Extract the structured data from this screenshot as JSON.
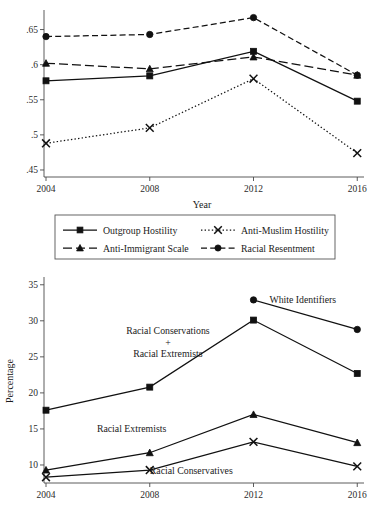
{
  "figure": {
    "title": "",
    "background": "#ffffff",
    "line_color": "#111111",
    "axis_color": "#4a4a4a"
  },
  "legend": {
    "items": [
      {
        "label": "Outgroup Hostility",
        "marker": "square",
        "dash": "solid"
      },
      {
        "label": "Anti-Muslim Hostility",
        "marker": "cross",
        "dash": "dotted"
      },
      {
        "label": "Anti-Immigrant Scale",
        "marker": "triangle",
        "dash": "long-dash"
      },
      {
        "label": "Racial Resentment",
        "marker": "circle",
        "dash": "dash"
      }
    ]
  },
  "chart_data": [
    {
      "type": "line",
      "title": "",
      "xlabel": "Year",
      "ylabel": "",
      "categories": [
        2004,
        2008,
        2012,
        2016
      ],
      "xticklabels": [
        "2004",
        "2008",
        "2012",
        "2016"
      ],
      "yticklabels": [
        ".45",
        ".5",
        ".55",
        ".6",
        ".65"
      ],
      "ylim": [
        0.44,
        0.675
      ],
      "yticks": [
        0.45,
        0.5,
        0.55,
        0.6,
        0.65
      ],
      "grid": false,
      "legend_position": "below",
      "series": [
        {
          "name": "Outgroup Hostility",
          "marker": "square",
          "dash": "solid",
          "values": [
            0.577,
            0.584,
            0.619,
            0.548
          ]
        },
        {
          "name": "Anti-Muslim Hostility",
          "marker": "cross",
          "dash": "dotted",
          "values": [
            0.488,
            0.51,
            0.58,
            0.474
          ]
        },
        {
          "name": "Anti-Immigrant Scale",
          "marker": "triangle",
          "dash": "long-dash",
          "values": [
            0.602,
            0.594,
            0.611,
            0.585
          ]
        },
        {
          "name": "Racial Resentment",
          "marker": "circle",
          "dash": "dash",
          "values": [
            0.64,
            0.643,
            0.667,
            0.585
          ]
        }
      ]
    },
    {
      "type": "line",
      "title": "",
      "xlabel": "",
      "ylabel": "Percentage",
      "categories": [
        2004,
        2008,
        2012,
        2016
      ],
      "xticklabels": [
        "2004",
        "2008",
        "2012",
        "2016"
      ],
      "yticklabels": [
        "10",
        "15",
        "20",
        "25",
        "30",
        "35"
      ],
      "ylim": [
        7.5,
        35.8
      ],
      "yticks": [
        10,
        15,
        20,
        25,
        30,
        35
      ],
      "grid": false,
      "legend_position": "inline-annotations",
      "series": [
        {
          "name": "White Identifiers",
          "marker": "circle",
          "dash": "solid",
          "values": [
            null,
            null,
            32.9,
            28.8
          ]
        },
        {
          "name": "Racial Conservations + Racial Extremists",
          "marker": "square",
          "dash": "solid",
          "values": [
            17.6,
            20.8,
            30.1,
            22.7
          ]
        },
        {
          "name": "Racial Extremists",
          "marker": "triangle",
          "dash": "solid",
          "values": [
            9.3,
            11.7,
            17.0,
            13.1
          ]
        },
        {
          "name": "Racial Conservatives",
          "marker": "cross",
          "dash": "solid",
          "values": [
            8.3,
            9.3,
            13.2,
            9.8
          ]
        }
      ],
      "annotations": [
        {
          "text": "White Identifiers",
          "x": 2013.9,
          "y": 32.9
        },
        {
          "text": "Racial Conservations",
          "x": 2008.7,
          "y": 28.6
        },
        {
          "text": "+",
          "x": 2008.7,
          "y": 27.0
        },
        {
          "text": "Racial Extremists",
          "x": 2008.7,
          "y": 25.5
        },
        {
          "text": "Racial Extremists",
          "x": 2007.3,
          "y": 15.1
        },
        {
          "text": "Racial Conservatives",
          "x": 2009.6,
          "y": 9.2
        }
      ]
    }
  ]
}
